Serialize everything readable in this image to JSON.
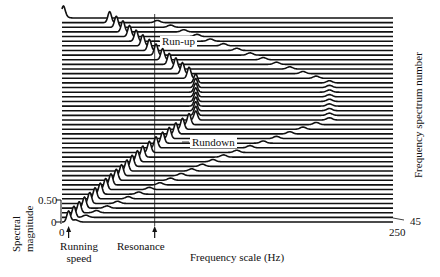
{
  "chart_data": {
    "type": "waterfall",
    "title": "",
    "xlabel": "Frequency scale (Hz)",
    "ylabel": "Spectral magnitude",
    "zlabel": "Frequency spectrum number",
    "x_ticks": [
      "0",
      "250"
    ],
    "y_ticks": [
      "0",
      "0.50"
    ],
    "z_ticks": [
      "45"
    ],
    "xlim": [
      0,
      250
    ],
    "ylim": [
      0,
      1.0
    ],
    "num_spectra": 45,
    "grid": false,
    "annotations": [
      {
        "text": "Run-up",
        "description": "running-speed peak sweeping up in frequency"
      },
      {
        "text": "Rundown",
        "description": "running-speed peak sweeping down in frequency"
      },
      {
        "text": "Running speed",
        "position": "x≈8 Hz arrow"
      },
      {
        "text": "Resonance",
        "position": "x≈70 Hz arrow, vertical reference line"
      }
    ],
    "resonance_hz": 70,
    "series": [
      {
        "name": "1x running speed peak (Hz) per spectrum, 1=bottom..45=top",
        "values": [
          5,
          9,
          13,
          17,
          21,
          25,
          29,
          33,
          37,
          41,
          45,
          49,
          53,
          57,
          61,
          66,
          71,
          76,
          81,
          86,
          91,
          96,
          101,
          101,
          101,
          101,
          101,
          101,
          101,
          101,
          101,
          96,
          91,
          86,
          81,
          76,
          71,
          66,
          61,
          56,
          51,
          46,
          41,
          36,
          1
        ]
      },
      {
        "name": "2x harmonic peak (Hz) per spectrum",
        "values": [
          10,
          18,
          26,
          34,
          42,
          50,
          58,
          66,
          74,
          82,
          90,
          98,
          106,
          114,
          122,
          132,
          142,
          152,
          162,
          172,
          182,
          192,
          202,
          202,
          202,
          202,
          202,
          202,
          202,
          202,
          202,
          192,
          182,
          172,
          162,
          152,
          142,
          132,
          122,
          112,
          102,
          92,
          82,
          72,
          2
        ]
      }
    ]
  },
  "labels": {
    "y_tick_050": "0.50",
    "y_tick_0": "0",
    "x_tick_0": "0",
    "x_tick_250": "250",
    "z_tick_45": "45",
    "ylabel_line1": "Spectral",
    "ylabel_line2": "magnitude",
    "zlabel": "Frequency spectrum number",
    "xlabel": "Frequency scale (Hz)",
    "running_speed_line1": "Running",
    "running_speed_line2": "speed",
    "resonance": "Resonance",
    "runup": "Run-up",
    "rundown": "Rundown"
  },
  "colors": {
    "ink": "#111111",
    "fill": "#ffffff",
    "background": "#ffffff"
  }
}
